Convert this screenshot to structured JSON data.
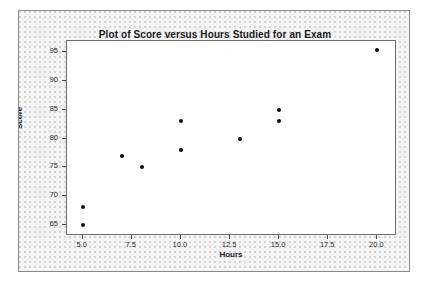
{
  "chart_data": {
    "type": "scatter",
    "title": "Plot of Score versus Hours Studied for an Exam",
    "xlabel": "Hours",
    "ylabel": "Score",
    "xlim": [
      4.2,
      21.0
    ],
    "ylim": [
      63.0,
      97.0
    ],
    "grid": false,
    "legend": null,
    "xticks": [
      "5.0",
      "7.5",
      "10.0",
      "12.5",
      "15.0",
      "17.5",
      "20.0"
    ],
    "xtick_values": [
      5.0,
      7.5,
      10.0,
      12.5,
      15.0,
      17.5,
      20.0
    ],
    "yticks": [
      "65",
      "70",
      "75",
      "80",
      "85",
      "90",
      "95"
    ],
    "ytick_values": [
      65,
      70,
      75,
      80,
      85,
      90,
      95
    ],
    "marker_color": "#0a0a0a",
    "points": [
      {
        "x": 5.0,
        "y": 68.0
      },
      {
        "x": 5.0,
        "y": 65.0
      },
      {
        "x": 7.0,
        "y": 77.0
      },
      {
        "x": 8.0,
        "y": 75.0
      },
      {
        "x": 10.0,
        "y": 83.0
      },
      {
        "x": 10.0,
        "y": 78.0
      },
      {
        "x": 13.0,
        "y": 80.0
      },
      {
        "x": 15.0,
        "y": 85.0
      },
      {
        "x": 15.0,
        "y": 83.0
      },
      {
        "x": 20.0,
        "y": 95.5
      }
    ]
  },
  "colors": {
    "panel_background": "#f4f4f4",
    "plot_background": "#ffffff",
    "border": "#8a8a8a",
    "axis": "#6e6e6e",
    "text": "#1a1a1a"
  }
}
